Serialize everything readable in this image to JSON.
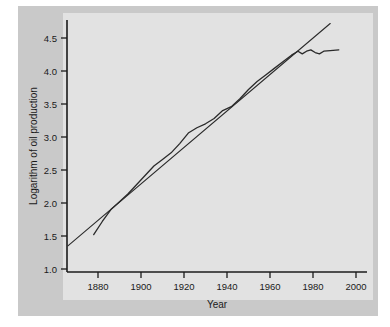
{
  "chart_data": {
    "type": "line",
    "title": "",
    "subtitle": "",
    "xlabel": "Year",
    "ylabel": "Logarithm of oil production",
    "xlim": [
      1866,
      2005
    ],
    "ylim": [
      0.88,
      4.78
    ],
    "grid": false,
    "legend": null,
    "xticks": [
      1880,
      1900,
      1920,
      1940,
      1960,
      1980,
      2000
    ],
    "xtick_labels": [
      "1880",
      "1900",
      "1920",
      "1940",
      "1960",
      "1980",
      "2000"
    ],
    "yticks": [
      1.0,
      1.5,
      2.0,
      2.5,
      3.0,
      3.5,
      4.0,
      4.5
    ],
    "ytick_labels": [
      "1.0",
      "1.5",
      "2.0",
      "2.5",
      "3.0",
      "3.5",
      "4.0",
      "4.5"
    ],
    "series": [
      {
        "name": "Logarithm of oil production",
        "kind": "data-curve",
        "x": [
          1878,
          1882,
          1886,
          1890,
          1894,
          1898,
          1902,
          1906,
          1910,
          1914,
          1918,
          1922,
          1926,
          1930,
          1934,
          1938,
          1942,
          1946,
          1950,
          1954,
          1958,
          1962,
          1966,
          1970,
          1973,
          1975,
          1977,
          1979,
          1981,
          1983,
          1985,
          1988,
          1992
        ],
        "values": [
          1.52,
          1.72,
          1.9,
          2.02,
          2.14,
          2.28,
          2.42,
          2.56,
          2.66,
          2.76,
          2.9,
          3.06,
          3.14,
          3.2,
          3.28,
          3.4,
          3.46,
          3.58,
          3.72,
          3.84,
          3.94,
          4.04,
          4.14,
          4.24,
          4.3,
          4.26,
          4.3,
          4.32,
          4.28,
          4.26,
          4.3,
          4.31,
          4.32
        ]
      },
      {
        "name": "Fitted exponential trend",
        "kind": "trend-line",
        "x": [
          1866,
          1988
        ],
        "values": [
          1.35,
          4.72
        ]
      }
    ]
  },
  "colors": {
    "page_background": "#ffffff",
    "outer_mat": "#c9c9c9",
    "plot_panel": "#e2e2e2",
    "axis": "#1b1b1b",
    "line": "#2a2a2a",
    "text": "#1a1a1a"
  }
}
